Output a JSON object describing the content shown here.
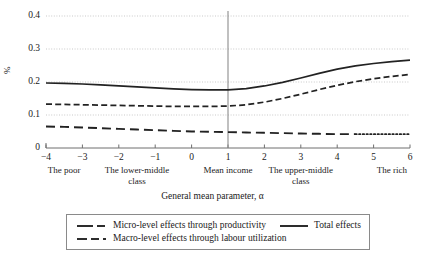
{
  "chart_data": {
    "type": "line",
    "title": "",
    "xlabel": "General mean parameter, α",
    "ylabel": "%",
    "xlim": [
      -4,
      6
    ],
    "ylim": [
      0,
      0.4
    ],
    "grid": true,
    "gridstyle": "horizontal dotted",
    "legend_position": "bottom",
    "y_ticks": [
      "0",
      "0.1",
      "0.2",
      "0.3",
      "0.4"
    ],
    "y_tick_values": [
      0,
      0.1,
      0.2,
      0.3,
      0.4
    ],
    "x_ticks": [
      "−4",
      "−3",
      "−2",
      "−1",
      "0",
      "1",
      "2",
      "3",
      "4",
      "5",
      "6"
    ],
    "x_tick_values": [
      -4,
      -3,
      -2,
      -1,
      0,
      1,
      2,
      3,
      4,
      5,
      6
    ],
    "category_labels": [
      {
        "text": "The poor",
        "x": -3.5
      },
      {
        "text": "The lower-middle class",
        "x": -1.5
      },
      {
        "text": "Mean income",
        "x": 1
      },
      {
        "text": "The upper-middle class",
        "x": 3
      },
      {
        "text": "The rich",
        "x": 5.5
      }
    ],
    "annotations": [
      {
        "type": "vertical-reference-line",
        "x": 1,
        "label": "Mean income"
      }
    ],
    "x": [
      -4,
      -3.5,
      -3,
      -2.5,
      -2,
      -1.5,
      -1,
      -0.5,
      0,
      0.5,
      1,
      1.5,
      2,
      2.5,
      3,
      3.5,
      4,
      4.5,
      5,
      5.5,
      6
    ],
    "series": [
      {
        "name": "Total effects",
        "style": "solid",
        "values": [
          0.197,
          0.196,
          0.194,
          0.191,
          0.188,
          0.185,
          0.182,
          0.179,
          0.177,
          0.176,
          0.176,
          0.18,
          0.188,
          0.199,
          0.212,
          0.226,
          0.239,
          0.249,
          0.256,
          0.262,
          0.266
        ]
      },
      {
        "name": "Macro-level effects through labour utilization",
        "style": "dashed",
        "values": [
          0.133,
          0.132,
          0.131,
          0.13,
          0.129,
          0.128,
          0.127,
          0.126,
          0.126,
          0.126,
          0.127,
          0.131,
          0.139,
          0.15,
          0.163,
          0.177,
          0.19,
          0.201,
          0.21,
          0.217,
          0.223
        ]
      },
      {
        "name": "Micro-level effects through productivity",
        "style": "long-dash-then-dotted",
        "dotted_from_x": 4.5,
        "values": [
          0.065,
          0.064,
          0.062,
          0.06,
          0.058,
          0.056,
          0.054,
          0.052,
          0.05,
          0.049,
          0.048,
          0.047,
          0.046,
          0.045,
          0.044,
          0.043,
          0.042,
          0.042,
          0.042,
          0.042,
          0.042
        ]
      }
    ]
  },
  "legend": {
    "entries": [
      {
        "label": "Micro-level effects through productivity",
        "style": "long-dash"
      },
      {
        "label": "Total effects",
        "style": "solid"
      },
      {
        "label": "Macro-level effects through labour utilization",
        "style": "dashed"
      }
    ]
  }
}
